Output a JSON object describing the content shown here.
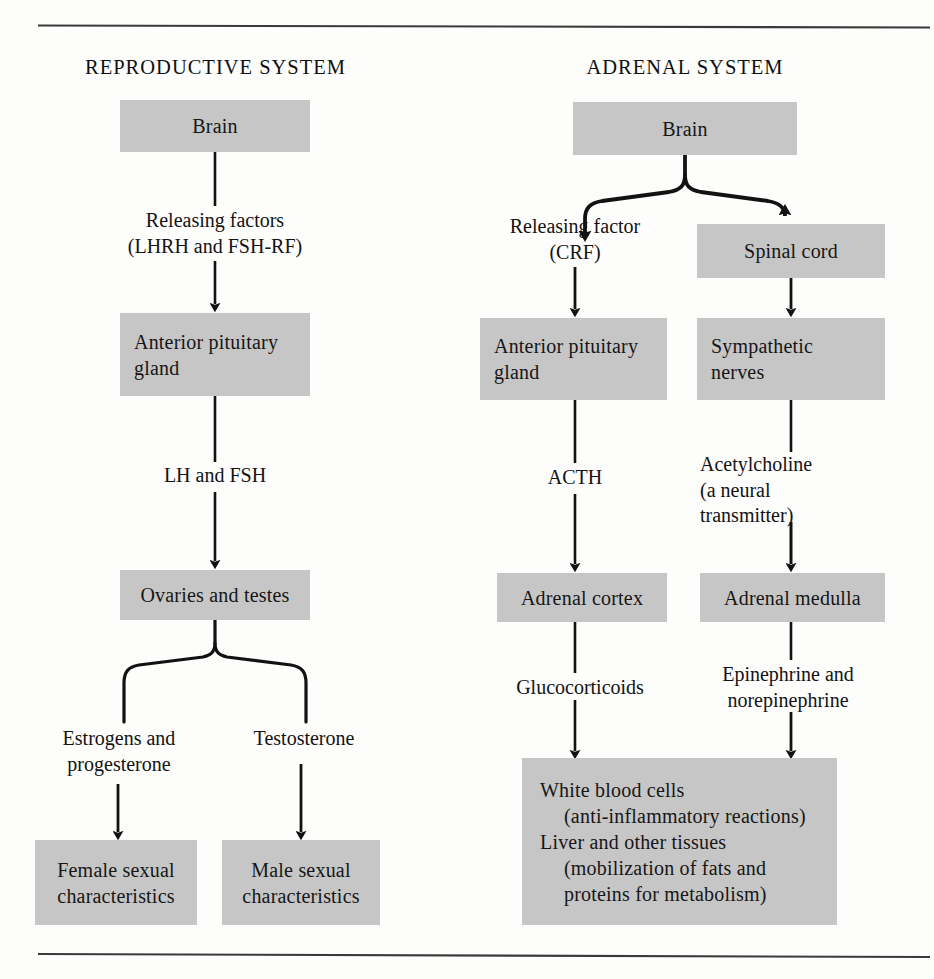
{
  "page": {
    "top_rule": "horizontal-rule",
    "bottom_rule": "horizontal-rule"
  },
  "columns": [
    {
      "id": "reproductive",
      "heading": "REPRODUCTIVE SYSTEM"
    },
    {
      "id": "adrenal",
      "heading": "ADRENAL SYSTEM"
    }
  ],
  "reproductive": {
    "brain": "Brain",
    "releasing_factors_line1": "Releasing factors",
    "releasing_factors_line2": "(LHRH and FSH-RF)",
    "anterior_pituitary_line1": "Anterior pituitary",
    "anterior_pituitary_line2": "gland",
    "lh_and_fsh": "LH and FSH",
    "ovaries_and_testes": "Ovaries and testes",
    "estrogens_line1": "Estrogens and",
    "estrogens_line2": "progesterone",
    "testosterone": "Testosterone",
    "female_line1": "Female sexual",
    "female_line2": "characteristics",
    "male_line1": "Male sexual",
    "male_line2": "characteristics"
  },
  "adrenal": {
    "brain": "Brain",
    "releasing_factor_line1": "Releasing factor",
    "releasing_factor_line2": "(CRF)",
    "spinal_cord": "Spinal cord",
    "anterior_pituitary_line1": "Anterior pituitary",
    "anterior_pituitary_line2": "gland",
    "sympathetic_line1": "Sympathetic",
    "sympathetic_line2": "nerves",
    "acth": "ACTH",
    "acetylcholine_line1": "Acetylcholine",
    "acetylcholine_line2": "(a neural",
    "acetylcholine_line3": "transmitter)",
    "adrenal_cortex": "Adrenal cortex",
    "adrenal_medulla": "Adrenal medulla",
    "glucocorticoids": "Glucocorticoids",
    "epinephrine_line1": "Epinephrine and",
    "epinephrine_line2": "norepinephrine",
    "targets_line1": "White blood cells",
    "targets_line2": "(anti-inflammatory reactions)",
    "targets_line3": "Liver and other tissues",
    "targets_line4": "(mobilization of fats and",
    "targets_line5": "proteins for metabolism)"
  },
  "colors": {
    "box_fill": "#c6c6c6",
    "stroke": "#121212",
    "background": "#fdfdfc",
    "text": "#131313"
  }
}
